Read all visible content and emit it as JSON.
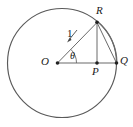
{
  "figure": {
    "type": "geometry-diagram",
    "stroke_color": "#555555",
    "label_color": "#1a1a1a",
    "background": "#ffffff",
    "circle": {
      "cx": 62,
      "cy": 63,
      "r": 54.5
    },
    "points": [
      {
        "name": "O",
        "label": "O",
        "x": 57.5,
        "y": 63,
        "dot": true,
        "label_x": 41,
        "label_y": 56
      },
      {
        "name": "R",
        "label": "R",
        "x": 97,
        "y": 22,
        "dot": true,
        "label_x": 96,
        "label_y": 5
      },
      {
        "name": "P",
        "label": "P",
        "x": 97,
        "y": 63,
        "dot": true,
        "label_x": 92,
        "label_y": 66
      },
      {
        "name": "Q",
        "label": "Q",
        "x": 116.5,
        "y": 63,
        "dot": true,
        "label_x": 120,
        "label_y": 55
      }
    ],
    "segments": [
      {
        "name": "OQ",
        "from": "O",
        "to": "Q"
      },
      {
        "name": "OR",
        "from": "O",
        "to": "R"
      },
      {
        "name": "RP",
        "from": "R",
        "to": "P"
      },
      {
        "name": "RQ",
        "from": "R",
        "to": "Q"
      }
    ],
    "arcs": [
      {
        "name": "arc-RQ",
        "from": "R",
        "to": "Q",
        "on_circle": true
      }
    ],
    "annotations": {
      "radius_label": "1",
      "angle_label": "θ",
      "angle_arc": {
        "vertex": "O",
        "radius": 19,
        "start_deg": 0,
        "end_deg": 46
      },
      "leader_arrow": {
        "from_x": 76,
        "from_y": 31,
        "to_x": 68,
        "to_y": 41
      }
    }
  }
}
